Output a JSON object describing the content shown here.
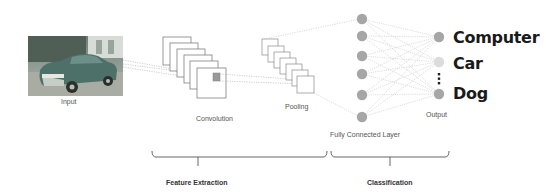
{
  "diagram": {
    "stages": {
      "input": {
        "label": "Input",
        "image_subject": "vintage car photo"
      },
      "convolution": {
        "label": "Convolution",
        "feature_maps": 6
      },
      "pooling": {
        "label": "Pooling",
        "feature_maps": 6
      },
      "fully_connected": {
        "label": "Fully Connected Layer",
        "nodes": 6
      },
      "output": {
        "label": "Output",
        "nodes": 3
      }
    },
    "output_classes": [
      "Computer",
      "Car",
      "Dog"
    ],
    "groups": {
      "feature_extraction": "Feature Extraction",
      "classification": "Classification"
    },
    "colors": {
      "node": "#a6a6a6",
      "node_highlight": "#dcdcdc",
      "connection": "#b8b8b8",
      "frame": "#7f7f7f",
      "text": "#555555",
      "class_text": "#1a1a1a"
    }
  }
}
